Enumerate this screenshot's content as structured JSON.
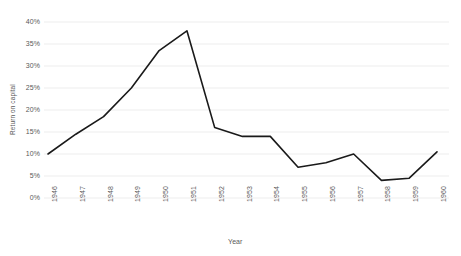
{
  "chart_data": {
    "type": "line",
    "title": "",
    "xlabel": "Year",
    "ylabel": "Return on capital",
    "categories": [
      "1946",
      "1947",
      "1948",
      "1949",
      "1950",
      "1951",
      "1952",
      "1953",
      "1954",
      "1955",
      "1956",
      "1957",
      "1958",
      "1959",
      "1960"
    ],
    "values": [
      10,
      14.5,
      18.5,
      25,
      33.5,
      38,
      16,
      14,
      14,
      7,
      8,
      10,
      4,
      4.5,
      10.5
    ],
    "series": [
      {
        "name": "Return on capital",
        "values": [
          10,
          14.5,
          18.5,
          25,
          33.5,
          38,
          16,
          14,
          14,
          7,
          8,
          10,
          4,
          4.5,
          10.5
        ]
      }
    ],
    "ylim": [
      0,
      40
    ],
    "yticks": [
      0,
      5,
      10,
      15,
      20,
      25,
      30,
      35,
      40
    ],
    "ytick_labels": [
      "0%",
      "5%",
      "10%",
      "15%",
      "20%",
      "25%",
      "30%",
      "35%",
      "40%"
    ],
    "grid": true,
    "grid_axis": "y",
    "legend": false,
    "legend_position": "none",
    "line_color": "#1a1a1a",
    "grid_color": "#e8e8e8",
    "text_color": "#595959",
    "background_color": "#ffffff"
  }
}
